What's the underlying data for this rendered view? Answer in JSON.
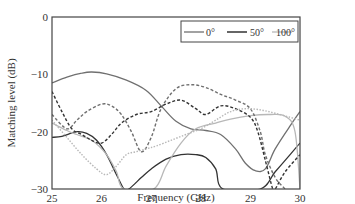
{
  "chart_data": {
    "type": "line",
    "title": "",
    "xlabel": "Frequency (GHz)",
    "ylabel": "Matching level (dB)",
    "xlim": [
      25,
      30
    ],
    "ylim": [
      -30,
      0
    ],
    "xticks": [
      25,
      26,
      27,
      28,
      29,
      30
    ],
    "yticks": [
      0,
      -10,
      -20,
      -30
    ],
    "grid": false,
    "legend_position": "top-right",
    "legend": [
      {
        "label": "0°",
        "color": "#707070",
        "style": "solid"
      },
      {
        "label": "50°",
        "color": "#333333",
        "style": "solid"
      },
      {
        "label": "100°",
        "color": "#b8b8b8",
        "style": "solid"
      }
    ],
    "series": [
      {
        "name": "0° (solid)",
        "color": "#707070",
        "dash": "",
        "x": [
          25,
          25.3,
          25.6,
          25.8,
          26.1,
          26.5,
          26.9,
          27.2,
          27.5,
          27.8,
          28.1,
          28.4,
          28.7,
          28.9,
          29.1,
          29.3,
          29.5,
          29.8,
          30
        ],
        "y": [
          -11.5,
          -10.5,
          -9.8,
          -9.6,
          -9.9,
          -11,
          -12.8,
          -15.5,
          -18.2,
          -19.5,
          -19.8,
          -20.5,
          -23,
          -25.5,
          -26.8,
          -26.5,
          -23,
          -19,
          -16.5
        ]
      },
      {
        "name": "50° (solid)",
        "color": "#333333",
        "dash": "",
        "x": [
          25,
          25.2,
          25.5,
          25.7,
          25.9,
          26.1,
          26.3,
          26.45,
          26.55,
          26.8,
          27.0,
          27.3,
          27.6,
          27.9,
          28.1,
          28.3,
          28.45,
          29.2,
          29.5,
          29.8,
          30
        ],
        "y": [
          -21,
          -20.8,
          -20,
          -20.3,
          -21.5,
          -24,
          -27.5,
          -30,
          -30,
          -28,
          -26.5,
          -24.8,
          -24,
          -24,
          -24.5,
          -26.5,
          -30,
          -30,
          -27,
          -24,
          -22
        ]
      },
      {
        "name": "100° (solid)",
        "color": "#b8b8b8",
        "dash": "",
        "x": [
          25,
          25.3,
          25.5,
          25.8,
          26.1,
          26.3,
          26.45,
          27.05,
          27.3,
          27.6,
          27.9,
          28.3,
          28.6,
          29.0,
          29.4,
          29.7,
          29.9,
          30
        ],
        "y": [
          -18.5,
          -19.8,
          -20.5,
          -21.5,
          -24,
          -27,
          -30,
          -30,
          -26,
          -22,
          -19.5,
          -18.5,
          -17.8,
          -17.2,
          -17,
          -17.3,
          -20,
          -30
        ]
      },
      {
        "name": "0° (dashed)",
        "color": "#707070",
        "dash": "3,2",
        "x": [
          25,
          25.3,
          25.5,
          25.7,
          26.0,
          26.2,
          26.4,
          26.6,
          26.8,
          27.0,
          27.2,
          27.5,
          27.8,
          28.1,
          28.4,
          28.7,
          29.0,
          29.2,
          29.3,
          29.5,
          29.7
        ],
        "y": [
          -17,
          -19.5,
          -18,
          -16.5,
          -15.2,
          -15.5,
          -17,
          -20,
          -23.5,
          -21,
          -16,
          -12.5,
          -11.8,
          -12.3,
          -13.5,
          -14.5,
          -16,
          -20,
          -24,
          -28,
          -30
        ]
      },
      {
        "name": "50° (dashed)",
        "color": "#333333",
        "dash": "3,2",
        "x": [
          25,
          25.2,
          25.4,
          25.6,
          25.8,
          26.0,
          26.2,
          26.4,
          26.7,
          27.0,
          27.3,
          27.6,
          27.9,
          28.1,
          28.4,
          28.7,
          29.0,
          29.15,
          29.3,
          29.45,
          29.5,
          29.7,
          30
        ],
        "y": [
          -13,
          -16.5,
          -19.5,
          -20.5,
          -21.5,
          -22,
          -20.5,
          -18.5,
          -17,
          -16.5,
          -15.2,
          -14.5,
          -16,
          -17,
          -15.5,
          -16,
          -17.5,
          -20,
          -25,
          -30,
          -30,
          -27,
          -24
        ]
      },
      {
        "name": "100° (dotted)",
        "color": "#b8b8b8",
        "dash": "1.5,1.5",
        "x": [
          25,
          25.3,
          25.6,
          25.9,
          26.1,
          26.3,
          26.5,
          26.7,
          26.9,
          27.1,
          27.4,
          27.7,
          28.0,
          28.3,
          28.6,
          28.9,
          29.2,
          29.5,
          29.8,
          30
        ],
        "y": [
          -18,
          -21,
          -24,
          -26.5,
          -27.5,
          -26,
          -24,
          -23.5,
          -23,
          -22.5,
          -21.5,
          -20.5,
          -19.5,
          -18,
          -16.5,
          -16,
          -16.2,
          -16.8,
          -17.5,
          -18
        ]
      }
    ]
  },
  "plot": {
    "left_px": 52,
    "right_px": 300,
    "top_px": 17,
    "bottom_px": 189
  }
}
